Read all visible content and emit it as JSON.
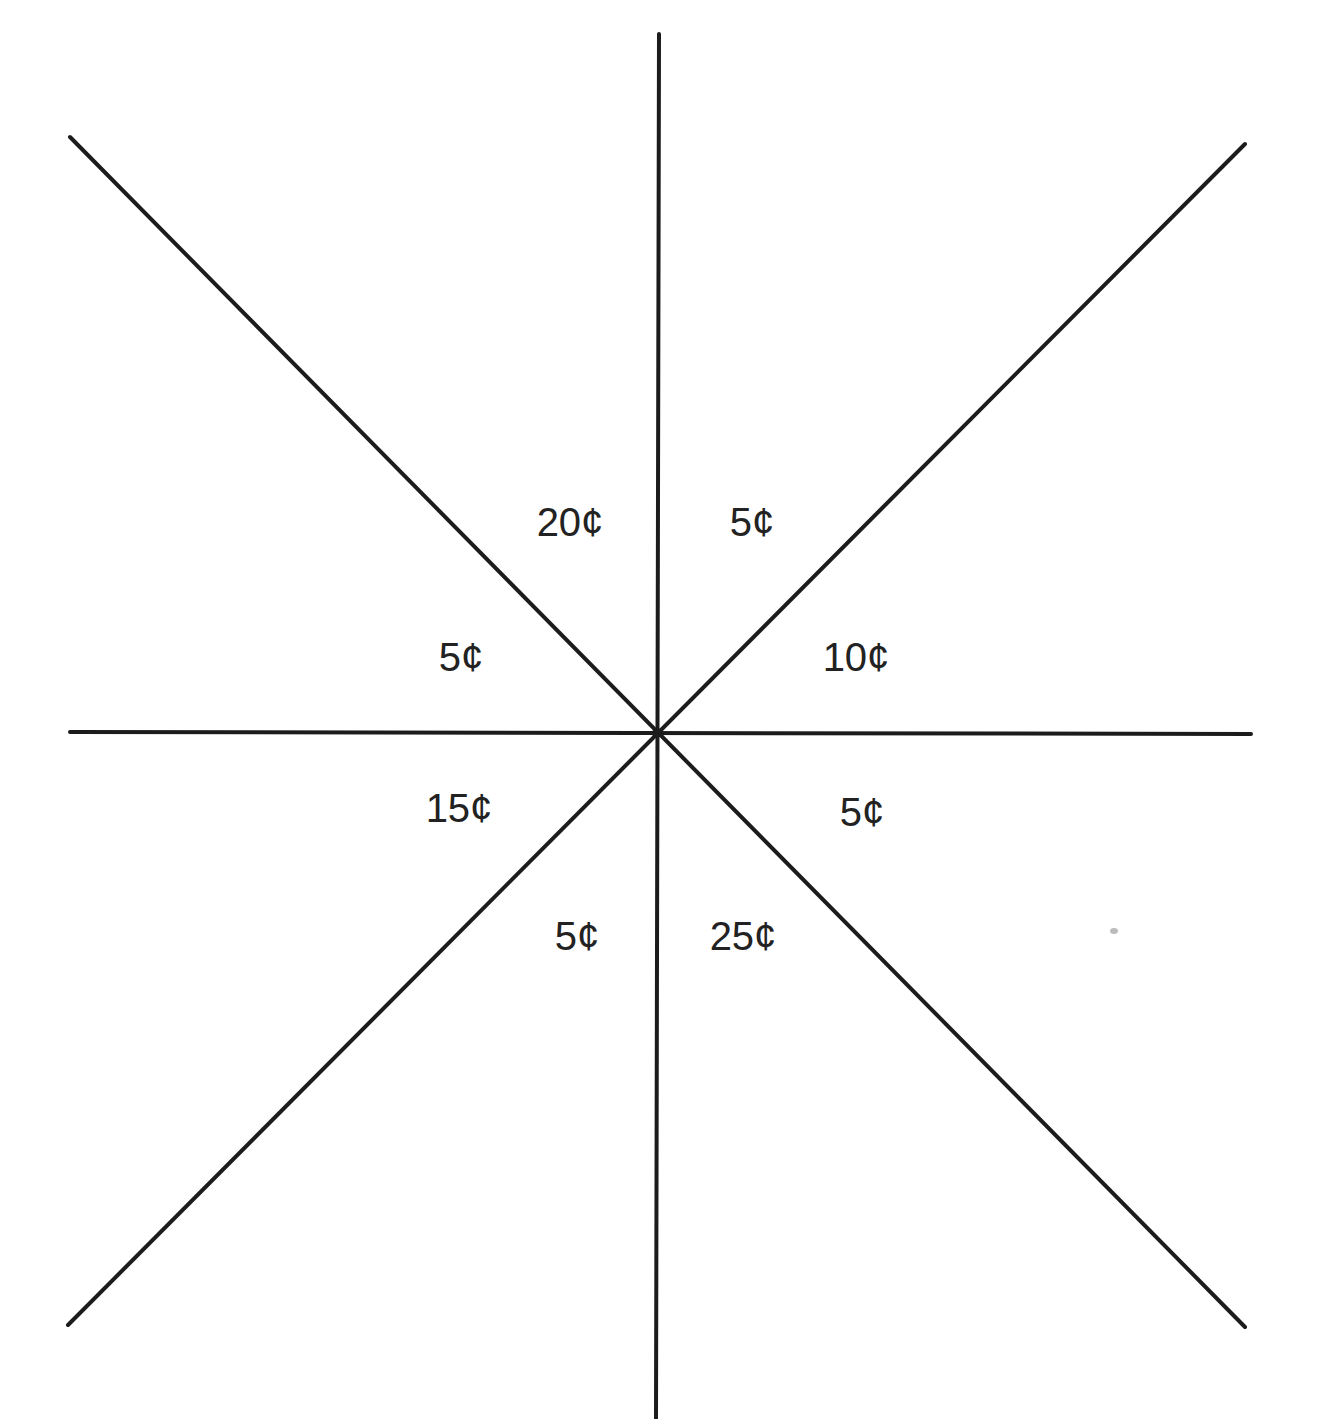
{
  "diagram": {
    "type": "spinner-wheel",
    "center": {
      "x": 657,
      "y": 733
    },
    "colors": {
      "line": "#1c1c1c",
      "text": "#222222",
      "background": "#ffffff"
    },
    "lines": [
      {
        "name": "vertical-line",
        "x1": 659,
        "y1": 34,
        "x2": 656,
        "y2": 1419
      },
      {
        "name": "horizontal-line",
        "x1": 70,
        "y1": 732,
        "x2": 1251,
        "y2": 734
      },
      {
        "name": "diagonal-nw-se-line",
        "x1": 70,
        "y1": 137,
        "x2": 1245,
        "y2": 1327
      },
      {
        "name": "diagonal-ne-sw-line",
        "x1": 1245,
        "y1": 144,
        "x2": 68,
        "y2": 1325
      }
    ],
    "sections": [
      {
        "label": "20¢",
        "x": 570,
        "y": 522
      },
      {
        "label": "5¢",
        "x": 752,
        "y": 522
      },
      {
        "label": "10¢",
        "x": 856,
        "y": 657
      },
      {
        "label": "5¢",
        "x": 862,
        "y": 812
      },
      {
        "label": "25¢",
        "x": 743,
        "y": 936
      },
      {
        "label": "5¢",
        "x": 577,
        "y": 936
      },
      {
        "label": "15¢",
        "x": 459,
        "y": 808
      },
      {
        "label": "5¢",
        "x": 461,
        "y": 657
      }
    ]
  }
}
